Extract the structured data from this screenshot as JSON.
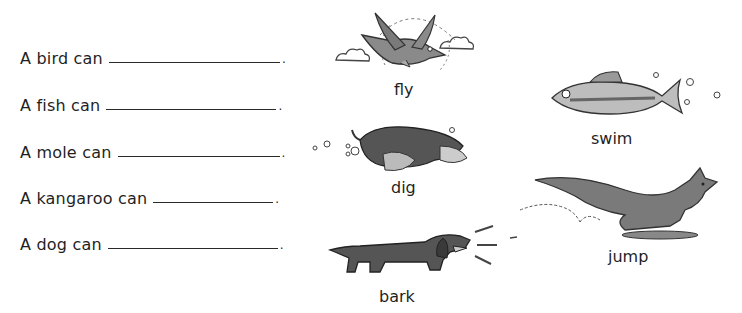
{
  "worksheet": {
    "sentences": [
      {
        "prompt": "A bird can",
        "answer": "",
        "period": "."
      },
      {
        "prompt": "A fish can",
        "answer": "",
        "period": "."
      },
      {
        "prompt": "A mole can",
        "answer": "",
        "period": "."
      },
      {
        "prompt": "A kangaroo can",
        "answer": "",
        "period": "."
      },
      {
        "prompt": "A dog can",
        "answer": "",
        "period": "."
      }
    ],
    "word_bank": [
      {
        "animal": "bird",
        "word": "fly",
        "icon": "bird-icon"
      },
      {
        "animal": "mole",
        "word": "dig",
        "icon": "mole-icon"
      },
      {
        "animal": "dog",
        "word": "bark",
        "icon": "dog-icon"
      },
      {
        "animal": "fish",
        "word": "swim",
        "icon": "fish-icon"
      },
      {
        "animal": "kangaroo",
        "word": "jump",
        "icon": "kangaroo-icon"
      }
    ]
  },
  "colors": {
    "ink": "#1f1f1f",
    "illustration_dark": "#4a4a4a",
    "illustration_mid": "#8a8a8a",
    "illustration_light": "#cfcfcf"
  }
}
